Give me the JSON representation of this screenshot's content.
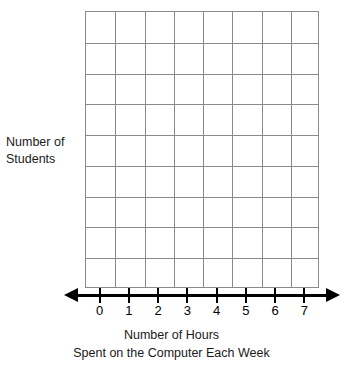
{
  "chart_data": {
    "type": "bar",
    "title": "",
    "subtitle": "",
    "xlabel": "Number of Hours\nSpent on the Computer Each Week",
    "ylabel": "Number of Students",
    "categories": [
      "0",
      "1",
      "2",
      "3",
      "4",
      "5",
      "6",
      "7"
    ],
    "values": [
      0,
      0,
      0,
      0,
      0,
      0,
      0,
      0
    ],
    "series": [
      {
        "name": "Number of Students",
        "values": [
          0,
          0,
          0,
          0,
          0,
          0,
          0,
          0
        ]
      }
    ],
    "xlim": [
      0,
      7
    ],
    "ylim": [
      0,
      9
    ],
    "grid": true,
    "grid_columns": 8,
    "grid_rows": 9,
    "legend": false,
    "legend_position": "none",
    "colors": {
      "grid_line": "#8a8a8a",
      "axis_line": "#000000",
      "text": "#1a1a1a",
      "background": "#ffffff"
    }
  },
  "axes": {
    "y": {
      "label_line_1": "Number of",
      "label_line_2": "Students",
      "label": "Number of\nStudents"
    },
    "x": {
      "tick_labels": [
        "0",
        "1",
        "2",
        "3",
        "4",
        "5",
        "6",
        "7"
      ],
      "caption_line_1": "Number of Hours",
      "caption_line_2": "Spent on the Computer Each Week"
    }
  }
}
